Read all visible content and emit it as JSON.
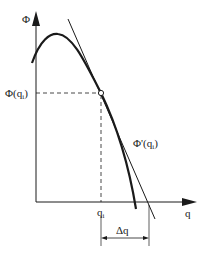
{
  "diagram": {
    "axes": {
      "y_label": "Φ",
      "x_label": "q"
    },
    "labels": {
      "phi_at_qi": "Φ(q",
      "phi_at_qi_sub": "i",
      "phi_at_qi_close": ")",
      "derivative": "Φ'(q",
      "derivative_sub": "i",
      "derivative_close": ")",
      "qi": "q",
      "qi_sub": "i",
      "delta_q": "Δq"
    },
    "colors": {
      "ink": "#1a1a1a",
      "background": "#ffffff"
    }
  }
}
